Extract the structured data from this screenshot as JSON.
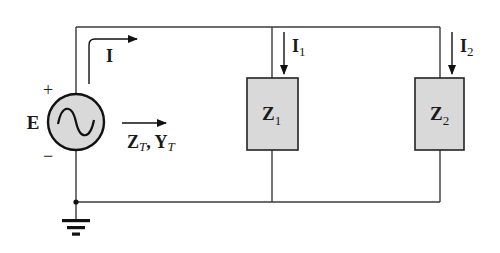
{
  "diagram": {
    "type": "parallel-ac-circuit",
    "source": {
      "label": "E",
      "plus_sign": "+",
      "minus_sign": "−",
      "symbol": "sine-wave",
      "fill_color": "#d9d9d9"
    },
    "total_current": {
      "label": "I"
    },
    "total_impedance": {
      "label_main_1": "Z",
      "label_sub_1": "T",
      "separator": ", ",
      "label_main_2": "Y",
      "label_sub_2": "T"
    },
    "branches": [
      {
        "impedance_main": "Z",
        "impedance_sub": "1",
        "current_main": "I",
        "current_sub": "1"
      },
      {
        "impedance_main": "Z",
        "impedance_sub": "2",
        "current_main": "I",
        "current_sub": "2"
      }
    ],
    "ground": {
      "symbol": "ground"
    },
    "colors": {
      "wire": "#3a3a3a",
      "box_fill": "#d9d9d9",
      "text": "#1a1a1a"
    }
  }
}
